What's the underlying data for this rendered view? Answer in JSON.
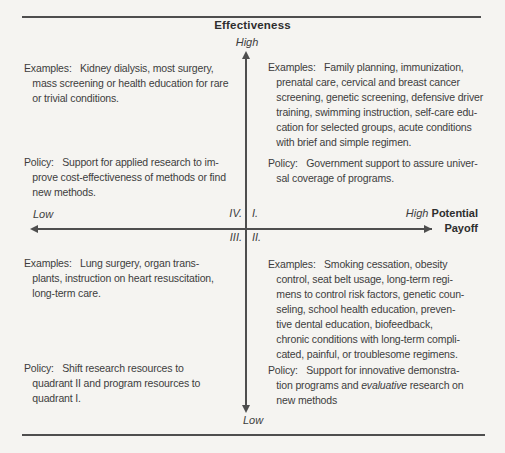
{
  "axes": {
    "vertical": {
      "title": "Effectiveness",
      "top_label": "High",
      "bottom_label": "Low"
    },
    "horizontal": {
      "left_label": "Low",
      "right_label": "High",
      "title_line1": "Potential",
      "title_line2": "Payoff"
    }
  },
  "quadrant_labels": {
    "top_left": "IV.",
    "top_right": "I.",
    "bottom_left": "III.",
    "bottom_right": "II."
  },
  "quadrants": {
    "top_left": {
      "examples": "Examples:   Kidney dialysis, most surgery,\n   mass screening or health education for rare\n   or trivial conditions.",
      "policy": "Policy:   Support for applied research to im-\n   prove cost-effectiveness of methods or find\n   new methods."
    },
    "top_right": {
      "examples": "Examples:   Family planning, immunization,\n   prenatal care, cervical and breast cancer\n   screening, genetic screening, defensive driver\n   training, swimming instruction, self-care edu-\n   cation for selected groups, acute conditions\n   with brief and simple regimen.",
      "policy": "Policy:   Government support to assure univer-\n   sal coverage of programs."
    },
    "bottom_left": {
      "examples": "Examples:   Lung surgery, organ trans-\n   plants, instruction on heart resuscitation,\n   long-term care.",
      "policy": "Policy:   Shift research resources to\n   quadrant II and program resources to\n   quadrant I."
    },
    "bottom_right": {
      "examples": "Examples:   Smoking cessation, obesity\n   control, seat belt usage, long-term regi-\n   mens to control risk factors, genetic coun-\n   seling, school health education, preven-\n   tive dental education, biofeedback,\n   chronic conditions with long-term compli-\n   cated, painful, or troublesome regimens.",
      "policy_before": "Policy:   Support for innovative demonstra-\n   tion programs and ",
      "policy_italic": "evaluative",
      "policy_after": " research on\n   new methods"
    }
  },
  "colors": {
    "background": "#f5f4f1",
    "line": "#4e4e4e",
    "text": "#3d3d3d"
  }
}
